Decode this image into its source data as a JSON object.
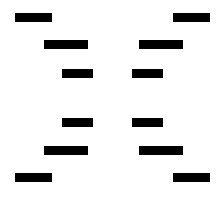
{
  "figure": {
    "width": 219,
    "height": 197,
    "background_color": "#ffffff",
    "bar_color": "#000000",
    "bar_count": 12,
    "row_count": 6,
    "column_count": 2,
    "symmetry": "bilateral-vertical-and-horizontal"
  },
  "chart_data": {
    "type": "bar",
    "xlabel": "",
    "ylabel": "",
    "grid": false,
    "legend": null,
    "xlim": [
      0,
      219
    ],
    "ylim": [
      0,
      197
    ],
    "bars": [
      {
        "id": "row1-left",
        "row": 1,
        "column": "left",
        "x": 15,
        "y": 13,
        "width": 37,
        "height": 9,
        "color": "#000000"
      },
      {
        "id": "row1-right",
        "row": 1,
        "column": "right",
        "x": 173,
        "y": 13,
        "width": 37,
        "height": 9,
        "color": "#000000"
      },
      {
        "id": "row2-left",
        "row": 2,
        "column": "left",
        "x": 44,
        "y": 40,
        "width": 44,
        "height": 9,
        "color": "#000000"
      },
      {
        "id": "row2-right",
        "row": 2,
        "column": "right",
        "x": 139,
        "y": 40,
        "width": 44,
        "height": 9,
        "color": "#000000"
      },
      {
        "id": "row3-left",
        "row": 3,
        "column": "left",
        "x": 62,
        "y": 69,
        "width": 31,
        "height": 9,
        "color": "#000000"
      },
      {
        "id": "row3-right",
        "row": 3,
        "column": "right",
        "x": 132,
        "y": 69,
        "width": 31,
        "height": 9,
        "color": "#000000"
      },
      {
        "id": "row4-left",
        "row": 4,
        "column": "left",
        "x": 62,
        "y": 118,
        "width": 31,
        "height": 9,
        "color": "#000000"
      },
      {
        "id": "row4-right",
        "row": 4,
        "column": "right",
        "x": 132,
        "y": 118,
        "width": 31,
        "height": 9,
        "color": "#000000"
      },
      {
        "id": "row5-left",
        "row": 5,
        "column": "left",
        "x": 44,
        "y": 146,
        "width": 44,
        "height": 9,
        "color": "#000000"
      },
      {
        "id": "row5-right",
        "row": 5,
        "column": "right",
        "x": 139,
        "y": 146,
        "width": 44,
        "height": 9,
        "color": "#000000"
      },
      {
        "id": "row6-left",
        "row": 6,
        "column": "left",
        "x": 15,
        "y": 173,
        "width": 37,
        "height": 9,
        "color": "#000000"
      },
      {
        "id": "row6-right",
        "row": 6,
        "column": "right",
        "x": 173,
        "y": 173,
        "width": 37,
        "height": 9,
        "color": "#000000"
      }
    ]
  }
}
